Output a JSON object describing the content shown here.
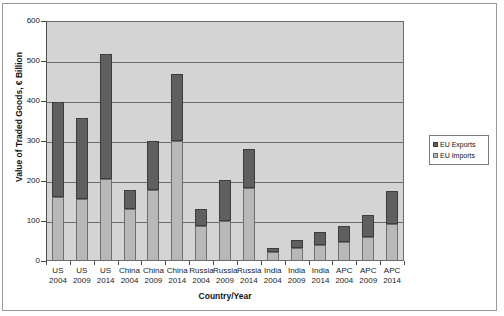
{
  "chart_data": {
    "type": "bar",
    "stacked": true,
    "title": "",
    "xlabel": "Country/Year",
    "ylabel": "Value of Traded Goods, € Billion",
    "ylim": [
      0,
      600
    ],
    "ytick_labels": [
      "600",
      "500",
      "400",
      "300",
      "200",
      "100",
      "0"
    ],
    "ytick_values": [
      600,
      500,
      400,
      300,
      200,
      100,
      0
    ],
    "grid": true,
    "legend_position": "right",
    "categories": [
      {
        "country": "US",
        "year": "2004"
      },
      {
        "country": "US",
        "year": "2009"
      },
      {
        "country": "US",
        "year": "2014"
      },
      {
        "country": "China",
        "year": "2004"
      },
      {
        "country": "China",
        "year": "2009"
      },
      {
        "country": "China",
        "year": "2014"
      },
      {
        "country": "Russia",
        "year": "2004"
      },
      {
        "country": "Russia",
        "year": "2009"
      },
      {
        "country": "Russia",
        "year": "2014"
      },
      {
        "country": "India",
        "year": "2004"
      },
      {
        "country": "India",
        "year": "2009"
      },
      {
        "country": "India",
        "year": "2014"
      },
      {
        "country": "APC",
        "year": "2004"
      },
      {
        "country": "APC",
        "year": "2009"
      },
      {
        "country": "APC",
        "year": "2014"
      }
    ],
    "series": [
      {
        "name": "EU Imports",
        "color": "#b8b8b8",
        "values": [
          160,
          155,
          205,
          130,
          178,
          300,
          88,
          100,
          183,
          22,
          33,
          40,
          48,
          60,
          92
        ]
      },
      {
        "name": "EU Exports",
        "color": "#5f5f5f",
        "values": [
          237,
          203,
          312,
          48,
          122,
          167,
          42,
          103,
          97,
          10,
          20,
          32,
          40,
          55,
          83
        ]
      }
    ],
    "totals": [
      397,
      358,
      517,
      178,
      300,
      467,
      130,
      203,
      280,
      32,
      53,
      72,
      88,
      115,
      175
    ]
  },
  "legend": {
    "items": [
      {
        "label": "EU Exports",
        "swatch": "exports-swatch"
      },
      {
        "label": "EU Imports",
        "swatch": "imports-swatch"
      }
    ]
  },
  "colors": {
    "plot_background": "#d4d4d4",
    "gridline": "#6b6b6b",
    "exports": "#5f5f5f",
    "imports": "#b8b8b8",
    "axis": "#4a4a4a"
  }
}
